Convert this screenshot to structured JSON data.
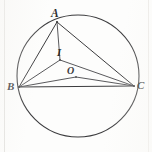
{
  "figure": {
    "type": "euclidean-geometry-diagram",
    "background_color": "#fdfdfc",
    "stroke_color": "#3c3c3e",
    "label_color": "#2c2c2e",
    "canvas": {
      "width": 152,
      "height": 152
    },
    "circle": {
      "name": "circumcircle",
      "cx": 78,
      "cy": 76,
      "r": 61,
      "stroke_width": 1.1
    },
    "points": [
      {
        "id": "A",
        "label": "A",
        "x": 57,
        "y": 22,
        "on_circle": true,
        "role": "triangle-vertex"
      },
      {
        "id": "B",
        "label": "B",
        "x": 19,
        "y": 87,
        "on_circle": true,
        "role": "triangle-vertex"
      },
      {
        "id": "C",
        "label": "C",
        "x": 134,
        "y": 86,
        "on_circle": true,
        "role": "triangle-vertex"
      },
      {
        "id": "I",
        "label": "I",
        "x": 60,
        "y": 60,
        "on_circle": false,
        "role": "incenter"
      },
      {
        "id": "O",
        "label": "O",
        "x": 76,
        "y": 77,
        "on_circle": false,
        "role": "circumcenter"
      }
    ],
    "segments": [
      {
        "id": "AB",
        "from": "A",
        "to": "B",
        "stroke_width": 1.0
      },
      {
        "id": "AC",
        "from": "A",
        "to": "C",
        "stroke_width": 1.0
      },
      {
        "id": "BC",
        "from": "B",
        "to": "C",
        "stroke_width": 1.0
      },
      {
        "id": "BI",
        "from": "B",
        "to": "I",
        "stroke_width": 0.9
      },
      {
        "id": "IC",
        "from": "I",
        "to": "C",
        "stroke_width": 0.9
      },
      {
        "id": "BO",
        "from": "B",
        "to": "O",
        "stroke_width": 0.9
      },
      {
        "id": "OC",
        "from": "O",
        "to": "C",
        "stroke_width": 0.9
      },
      {
        "id": "AI",
        "from": "A",
        "to": "I",
        "stroke_width": 0.9
      }
    ],
    "labels": {
      "A": "A",
      "B": "B",
      "C": "C",
      "I": "I",
      "O": "O"
    }
  }
}
